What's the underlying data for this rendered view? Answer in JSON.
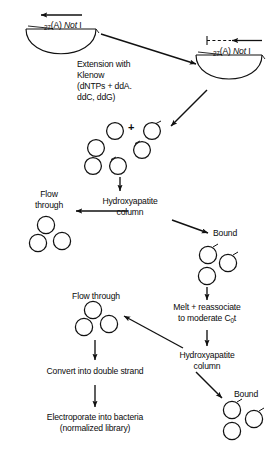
{
  "diagram": {
    "ink_color": "#111111",
    "background": "#ffffff",
    "labels": {
      "template_left_sub": "27",
      "template_left_rest": "(A)",
      "template_left_italic": "Not",
      "template_left_enzyme": "I",
      "template_right_sub": "27",
      "template_right_rest": "(A)",
      "template_right_italic": "Not",
      "template_right_enzyme": "I",
      "extension_line1": "Extension with",
      "extension_line2": "Klenow",
      "extension_line3": "(dNTPs + ddA.",
      "extension_line4": "ddC, ddG)",
      "plus_sign": "+",
      "flow_through_1_line1": "Flow",
      "flow_through_1_line2": "through",
      "hydroxyapatite_1_line1": "Hydroxyapatite",
      "hydroxyapatite_1_line2": "column",
      "bound_1": "Bound",
      "melt_line1": "Melt + reassociate",
      "melt_line2_pre": "to moderate C",
      "melt_line2_sub": "0",
      "melt_line2_post": "t",
      "hydroxyapatite_2_line1": "Hydroxyapatite",
      "hydroxyapatite_2_line2": "column",
      "bound_2": "Bound",
      "flow_through_2": "Flow through",
      "convert": "Convert into double strand",
      "electroporate_line1": "Electroporate into bacteria",
      "electroporate_line2": "(normalized library)"
    }
  }
}
